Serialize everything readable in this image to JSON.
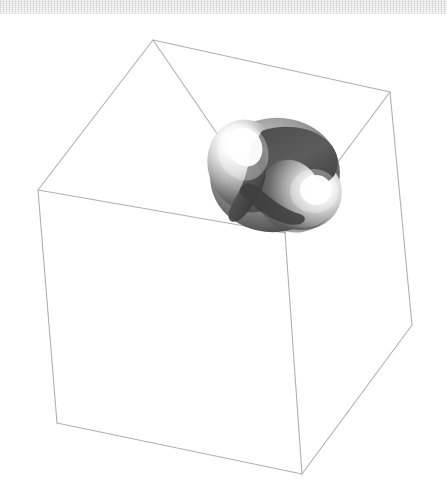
{
  "canvas": {
    "width": 447,
    "height": 503,
    "background_color": "#ffffff",
    "title": "3D implicit surface plot"
  },
  "top_artifact_band": {
    "name": "scan-artifact-band",
    "height": 14,
    "color": "#f2f2f2"
  },
  "bounding_box": {
    "label": "wireframe bounding cube",
    "line_color": "#b0b0b0",
    "line_width": 1,
    "vertices": {
      "back_top": [
        153,
        40
      ],
      "left_top": [
        38,
        190
      ],
      "right_top": [
        390,
        92
      ],
      "center_top": [
        285,
        233
      ],
      "left_bottom": [
        57,
        423
      ],
      "right_bottom": [
        412,
        325
      ],
      "front_bottom": [
        302,
        474
      ]
    },
    "edges": [
      [
        "back_top",
        "left_top"
      ],
      [
        "back_top",
        "right_top"
      ],
      [
        "back_top",
        "center_top"
      ],
      [
        "left_top",
        "center_top"
      ],
      [
        "right_top",
        "center_top"
      ],
      [
        "left_top",
        "left_bottom"
      ],
      [
        "right_top",
        "right_bottom"
      ],
      [
        "center_top",
        "front_bottom"
      ],
      [
        "left_bottom",
        "front_bottom"
      ],
      [
        "right_bottom",
        "front_bottom"
      ]
    ]
  },
  "surface": {
    "label": "shaded double-sphere implicit surface",
    "type": "blob",
    "center": [
      275,
      175
    ],
    "radius_x": 65,
    "radius_y": 57,
    "shading": "glossy grayscale",
    "highlight_color": "#ffffff",
    "midtone_color": "#9a9a9a",
    "shadow_color": "#404040",
    "dark_notch_color": "#4a4a4a",
    "lobes": [
      {
        "name": "upper-left-lobe",
        "center": [
          247,
          165
        ],
        "rx": 38,
        "ry": 45,
        "highlight": [
          243,
          143
        ]
      },
      {
        "name": "lower-right-lobe",
        "center": [
          300,
          193
        ],
        "rx": 40,
        "ry": 37,
        "highlight": [
          317,
          188
        ]
      }
    ],
    "crescent_cutout": {
      "name": "dark-crescent-notch",
      "region": "upper-right",
      "color": "#545454"
    }
  },
  "chart_data": {
    "type": "surface3d",
    "xlabel": "",
    "ylabel": "",
    "zlabel": "",
    "grid": false,
    "legend": "none",
    "axis_ticks": [],
    "objects": [
      {
        "name": "bounding-cube",
        "kind": "wireframe",
        "color": "#b0b0b0"
      },
      {
        "name": "implicit-surface",
        "kind": "shaded-solid",
        "colormap": "grayscale"
      }
    ]
  }
}
